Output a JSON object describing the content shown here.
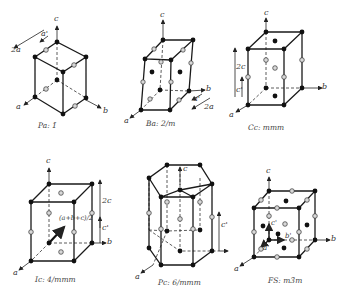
{
  "figure": {
    "panels": [
      {
        "id": "triclinic",
        "caption": "Pa: 1̄",
        "axes": {
          "a": "a",
          "b": "b",
          "c": "c"
        },
        "annotations": [
          "2a",
          "a'"
        ]
      },
      {
        "id": "monoclinic",
        "caption": "Ba: 2/m",
        "axes": {
          "a": "a",
          "b": "b",
          "c": "c"
        },
        "annotations": [
          "a'",
          "2a"
        ]
      },
      {
        "id": "orthorhombic",
        "caption": "Cc: mmm",
        "axes": {
          "a": "a",
          "b": "b",
          "c": "c"
        },
        "annotations": [
          "2c",
          "c'"
        ]
      },
      {
        "id": "tetragonal",
        "caption": "Ic: 4/mmm",
        "axes": {
          "a": "a",
          "b": "b",
          "c": "c"
        },
        "annotations": [
          "(a+b+c)/2",
          "2c",
          "c'"
        ]
      },
      {
        "id": "hexagonal",
        "caption": "Pc: 6/mmm",
        "axes": {
          "a": "a",
          "c": "c"
        },
        "annotations": [
          "c'"
        ]
      },
      {
        "id": "cubic",
        "caption": "FS: m3̄m",
        "axes": {
          "a": "a",
          "b": "b",
          "c": "c"
        },
        "annotations": [
          "c'",
          "b'",
          "a'"
        ]
      }
    ]
  }
}
